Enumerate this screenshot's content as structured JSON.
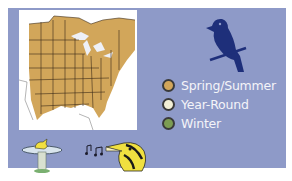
{
  "legend": {
    "items": [
      {
        "label": "Spring/Summer",
        "color": "#d2a65a"
      },
      {
        "label": "Year-Round",
        "color": "#f2efd6"
      },
      {
        "label": "Winter",
        "color": "#7c9c52"
      }
    ]
  },
  "colors": {
    "panel_background": "#8e9ac8",
    "range_fill": "#d2a65a",
    "bird_silhouette": "#1e2f7a"
  },
  "icons": [
    "bird-silhouette-icon",
    "bird-feeder-icon",
    "music-notes-icon",
    "singing-bird-icon"
  ]
}
